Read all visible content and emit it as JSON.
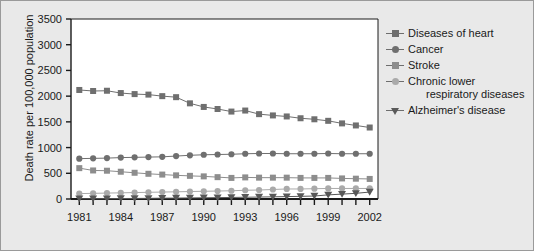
{
  "chart_data": {
    "type": "line",
    "title": "",
    "xlabel": "",
    "ylabel": "Death rate per 100,000 population",
    "xlim": [
      1980.4,
      2002.6
    ],
    "ylim": [
      0,
      3500
    ],
    "yticks": [
      0,
      500,
      1000,
      1500,
      2000,
      2500,
      3000,
      3500
    ],
    "ytick_labels": [
      "0",
      "500",
      "1000",
      "1500",
      "2000",
      "2500",
      "3000",
      "3500"
    ],
    "x": [
      1981,
      1982,
      1983,
      1984,
      1985,
      1986,
      1987,
      1988,
      1989,
      1990,
      1991,
      1992,
      1993,
      1994,
      1995,
      1996,
      1997,
      1998,
      1999,
      2000,
      2001,
      2002
    ],
    "xticks": [
      1981,
      1982,
      1983,
      1984,
      1985,
      1986,
      1987,
      1988,
      1989,
      1990,
      1991,
      1992,
      1993,
      1994,
      1995,
      1996,
      1997,
      1998,
      1999,
      2000,
      2001,
      2002
    ],
    "xtick_labels_shown": [
      "1981",
      "1984",
      "1987",
      "1990",
      "1993",
      "1996",
      "1999",
      "2002"
    ],
    "grid": false,
    "legend_position": "right",
    "series": [
      {
        "name": "Diseases of heart",
        "marker": "square",
        "color": "#6f6f6f",
        "values": [
          2120,
          2100,
          2105,
          2060,
          2040,
          2030,
          2000,
          1980,
          1860,
          1790,
          1750,
          1700,
          1720,
          1650,
          1625,
          1605,
          1570,
          1550,
          1520,
          1470,
          1430,
          1390
        ]
      },
      {
        "name": "Cancer",
        "marker": "circle",
        "color": "#6f6f6f",
        "values": [
          785,
          790,
          795,
          805,
          810,
          815,
          820,
          835,
          850,
          860,
          865,
          870,
          880,
          885,
          885,
          880,
          880,
          880,
          885,
          880,
          880,
          880
        ]
      },
      {
        "name": "Stroke",
        "marker": "square",
        "color": "#8d8d8d",
        "values": [
          600,
          555,
          550,
          530,
          510,
          490,
          475,
          460,
          450,
          440,
          425,
          410,
          420,
          415,
          415,
          415,
          410,
          410,
          410,
          400,
          395,
          390
        ]
      },
      {
        "name": "Chronic lower respiratory diseases",
        "marker": "circle",
        "color": "#aaaaaa",
        "values": [
          105,
          110,
          115,
          120,
          125,
          130,
          135,
          140,
          145,
          150,
          155,
          160,
          170,
          175,
          185,
          195,
          195,
          200,
          205,
          205,
          205,
          205
        ]
      },
      {
        "name": "Alzheimer's disease",
        "marker": "triangle-down",
        "color": "#585858",
        "values": [
          5,
          6,
          7,
          9,
          11,
          13,
          16,
          18,
          21,
          24,
          27,
          30,
          34,
          38,
          42,
          47,
          52,
          58,
          80,
          95,
          110,
          135
        ]
      }
    ]
  },
  "axis": {
    "y_label": "Death rate per 100,000 population"
  },
  "legend": {
    "items": [
      {
        "label": "Diseases of heart",
        "label_cont": ""
      },
      {
        "label": "Cancer",
        "label_cont": ""
      },
      {
        "label": "Stroke",
        "label_cont": ""
      },
      {
        "label": "Chronic lower",
        "label_cont": "respiratory diseases"
      },
      {
        "label": "Alzheimer's disease",
        "label_cont": ""
      }
    ]
  }
}
